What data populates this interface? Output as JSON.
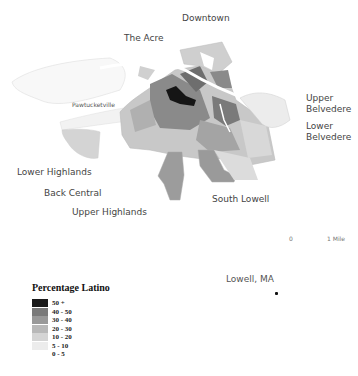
{
  "map": {
    "neighborhoods": [
      {
        "name": "Downtown"
      },
      {
        "name": "The Acre"
      },
      {
        "name": "Pawtucketville"
      },
      {
        "name": "Upper Belvedere",
        "line1": "Upper",
        "line2": "Belvedere"
      },
      {
        "name": "Lower Belvedere",
        "line1": "Lower",
        "line2": "Belvedere"
      },
      {
        "name": "Lower Highlands"
      },
      {
        "name": "Back Central"
      },
      {
        "name": "Upper Highlands"
      },
      {
        "name": "South Lowell"
      }
    ],
    "scale_bar": {
      "start": "0",
      "end": "1 Mile"
    },
    "inset_label": "Lowell, MA"
  },
  "legend": {
    "title": "Percentage Latino",
    "classes": [
      {
        "label": "50 +",
        "color": "#1a1a1a"
      },
      {
        "label": "40 - 50",
        "color": "#7a7a7a"
      },
      {
        "label": "30 - 40",
        "color": "#999999"
      },
      {
        "label": "20 - 30",
        "color": "#b8b8b8"
      },
      {
        "label": "10 - 20",
        "color": "#d4d4d4"
      },
      {
        "label": "5 - 10",
        "color": "#ececec"
      },
      {
        "label": "0 - 5",
        "color": "#ffffff"
      }
    ]
  }
}
